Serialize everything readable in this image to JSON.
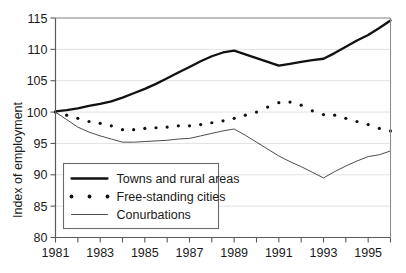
{
  "chart_data": {
    "type": "line",
    "title": "",
    "xlabel": "",
    "ylabel": "Index of employment",
    "xlim": [
      1981,
      1996
    ],
    "ylim": [
      80,
      115
    ],
    "grid": true,
    "legend_position": "lower-left-inside",
    "y_ticks": [
      80,
      85,
      90,
      95,
      100,
      105,
      110,
      115
    ],
    "y_tick_labels": [
      "80",
      "85",
      "90",
      "95",
      "100",
      "105",
      "110",
      "115"
    ],
    "x_ticks": [
      1981,
      1982,
      1983,
      1984,
      1985,
      1986,
      1987,
      1988,
      1989,
      1990,
      1991,
      1992,
      1993,
      1994,
      1995,
      1996
    ],
    "x_tick_labels": [
      "1981",
      "",
      "1983",
      "",
      "1985",
      "",
      "1987",
      "",
      "1989",
      "",
      "1991",
      "",
      "1993",
      "",
      "1995",
      ""
    ],
    "x": [
      1981.0,
      1981.5,
      1982.0,
      1982.5,
      1983.0,
      1983.5,
      1984.0,
      1984.5,
      1985.0,
      1985.5,
      1986.0,
      1986.5,
      1987.0,
      1987.5,
      1988.0,
      1988.5,
      1989.0,
      1989.5,
      1990.0,
      1990.5,
      1991.0,
      1991.5,
      1992.0,
      1992.5,
      1993.0,
      1993.5,
      1994.0,
      1994.5,
      1995.0,
      1995.5,
      1996.0
    ],
    "series": [
      {
        "name": "Towns and rural areas",
        "style": "thick-solid",
        "color": "#111111",
        "values": [
          100.1,
          100.3,
          100.6,
          101.0,
          101.3,
          101.7,
          102.3,
          103.0,
          103.7,
          104.5,
          105.4,
          106.3,
          107.2,
          108.1,
          108.9,
          109.5,
          109.8,
          109.2,
          108.6,
          108.0,
          107.4,
          107.7,
          108.0,
          108.3,
          108.5,
          109.4,
          110.4,
          111.4,
          112.3,
          113.4,
          114.6
        ]
      },
      {
        "name": "Free-standing cities",
        "style": "dotted",
        "color": "#111111",
        "values": [
          100.0,
          99.5,
          99.0,
          98.5,
          98.2,
          97.8,
          97.2,
          97.2,
          97.4,
          97.5,
          97.6,
          97.8,
          97.8,
          98.0,
          98.3,
          98.6,
          99.0,
          99.5,
          100.0,
          100.8,
          101.5,
          101.6,
          101.1,
          100.2,
          99.6,
          99.5,
          99.0,
          98.5,
          98.0,
          97.4,
          97.0
        ]
      },
      {
        "name": "Conurbations",
        "style": "thin-solid",
        "color": "#4d4d4d",
        "values": [
          100.0,
          98.8,
          97.6,
          96.8,
          96.2,
          95.7,
          95.2,
          95.2,
          95.3,
          95.4,
          95.5,
          95.7,
          95.8,
          96.2,
          96.6,
          97.0,
          97.3,
          96.3,
          95.2,
          94.1,
          93.0,
          92.1,
          91.3,
          90.4,
          89.5,
          90.5,
          91.4,
          92.2,
          92.9,
          93.2,
          93.8
        ]
      }
    ],
    "series_extra_free_standing": [
      97.0,
      96.8,
      96.5,
      96.4,
      96.8,
      97.3,
      97.8,
      98.2,
      98.6,
      99.3,
      99.9,
      100.4,
      100.9
    ],
    "legend": [
      {
        "label": "Towns and rural areas",
        "marker": "thick-line"
      },
      {
        "label": "Free-standing cities",
        "marker": "dots"
      },
      {
        "label": "Conurbations",
        "marker": "thin-line"
      }
    ]
  }
}
